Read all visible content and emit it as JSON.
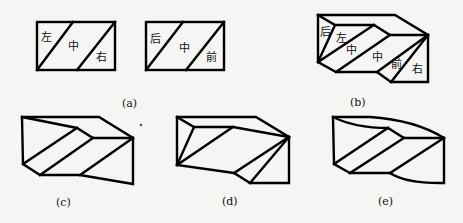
{
  "figures": {
    "a": {
      "caption": "(a)",
      "left_box": {
        "labels": {
          "left": "左",
          "middle": "中",
          "right": "右"
        }
      },
      "right_box": {
        "labels": {
          "back": "后",
          "middle": "中",
          "front": "前"
        }
      }
    },
    "b": {
      "caption": "(b)",
      "labels": {
        "back": "后",
        "left": "左",
        "middle1": "中",
        "middle2": "中",
        "front": "前",
        "right": "右"
      }
    },
    "c": {
      "caption": "(c)"
    },
    "d": {
      "caption": "(d)"
    },
    "e": {
      "caption": "(e)"
    }
  },
  "colors": {
    "line": "#000000",
    "background": "#f5f5f3"
  }
}
